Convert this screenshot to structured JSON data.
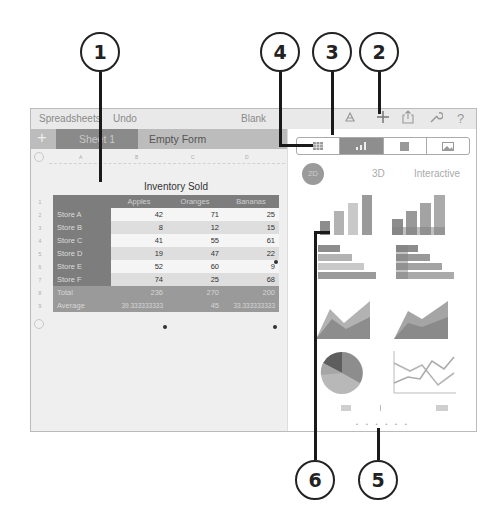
{
  "callouts": [
    {
      "id": "1",
      "label": "1"
    },
    {
      "id": "2",
      "label": "2"
    },
    {
      "id": "3",
      "label": "3"
    },
    {
      "id": "4",
      "label": "4"
    },
    {
      "id": "5",
      "label": "5"
    },
    {
      "id": "6",
      "label": "6"
    }
  ],
  "toolbar": {
    "back_label": "Spreadsheets",
    "undo_label": "Undo",
    "title": "Blank",
    "icons": [
      "format-brush-icon",
      "plus-icon",
      "share-icon",
      "wrench-icon",
      "help-icon"
    ],
    "help_glyph": "?"
  },
  "sheet_tabs": {
    "add_glyph": "+",
    "tabs": [
      {
        "label": "Sheet 1",
        "active": true
      },
      {
        "label": "Empty Form",
        "active": false
      }
    ]
  },
  "spreadsheet": {
    "column_headers": [
      "A",
      "B",
      "C",
      "D"
    ],
    "row_headers": [
      "1",
      "2",
      "3",
      "4",
      "5",
      "6",
      "7",
      "8",
      "9"
    ],
    "title": "Inventory Sold",
    "header_row": [
      "",
      "Apples",
      "Oranges",
      "Bananas"
    ],
    "rows": [
      {
        "label": "Store A",
        "values": [
          "42",
          "71",
          "25"
        ]
      },
      {
        "label": "Store B",
        "values": [
          "8",
          "12",
          "15"
        ]
      },
      {
        "label": "Store C",
        "values": [
          "41",
          "55",
          "61"
        ]
      },
      {
        "label": "Store D",
        "values": [
          "19",
          "47",
          "22"
        ]
      },
      {
        "label": "Store E",
        "values": [
          "52",
          "60",
          "9"
        ]
      },
      {
        "label": "Store F",
        "values": [
          "74",
          "25",
          "68"
        ]
      }
    ],
    "footer_rows": [
      {
        "label": "Total",
        "values": [
          "236",
          "270",
          "200"
        ]
      },
      {
        "label": "Average",
        "values": [
          "39.333333333",
          "45",
          "33.333333333"
        ]
      }
    ]
  },
  "insert_popover": {
    "segments": [
      {
        "name": "table",
        "active": false
      },
      {
        "name": "chart",
        "active": true
      },
      {
        "name": "shape",
        "active": false
      },
      {
        "name": "media",
        "active": false
      }
    ],
    "chart_tabs": [
      {
        "label": "2D",
        "active": true
      },
      {
        "label": "3D",
        "active": false
      },
      {
        "label": "Interactive",
        "active": false
      }
    ],
    "chart_types": [
      "column-chart",
      "stacked-column-chart",
      "bar-chart",
      "stacked-bar-chart",
      "area-chart",
      "stacked-area-chart",
      "pie-chart",
      "line-chart"
    ],
    "page_dots": "• • • • • •"
  }
}
